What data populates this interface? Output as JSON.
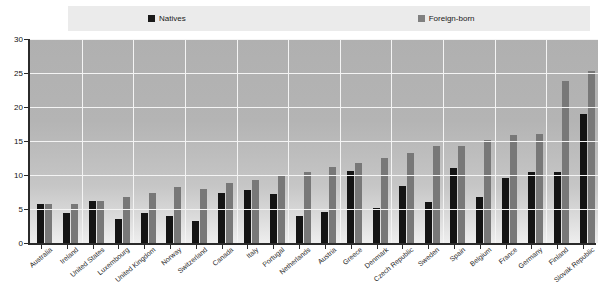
{
  "legend": {
    "items": [
      {
        "label": "Natives",
        "color": "#141414",
        "icon": "square-marker"
      },
      {
        "label": "Foreign-born",
        "color": "#787878",
        "icon": "square-marker"
      }
    ]
  },
  "chart_data": {
    "type": "bar",
    "title": "",
    "xlabel": "",
    "ylabel": "",
    "ylim": [
      0,
      30
    ],
    "yticks": [
      0,
      5,
      10,
      15,
      20,
      25,
      30
    ],
    "grid": true,
    "legend_position": "top",
    "categories": [
      "Australia",
      "Ireland",
      "United States",
      "Luxembourg",
      "United Kingdom",
      "Norway",
      "Switzerland",
      "Canada",
      "Italy",
      "Portugal",
      "Netherlands",
      "Austria",
      "Greece",
      "Denmark",
      "Czech Republic",
      "Sweden",
      "Spain",
      "Belgium",
      "France",
      "Germany",
      "Finland",
      "Slovak Republic"
    ],
    "series": [
      {
        "name": "Natives",
        "color": "#141414",
        "values": [
          5.8,
          4.4,
          6.2,
          3.5,
          4.4,
          4.0,
          3.3,
          7.3,
          7.8,
          7.2,
          4.0,
          4.6,
          10.6,
          5.2,
          8.4,
          6.0,
          11.0,
          6.8,
          9.5,
          10.4,
          10.5,
          19.0
        ]
      },
      {
        "name": "Foreign-born",
        "color": "#787878",
        "values": [
          5.8,
          5.7,
          6.2,
          6.7,
          7.4,
          8.3,
          8.0,
          8.8,
          9.3,
          10.0,
          10.5,
          11.2,
          11.8,
          12.5,
          13.2,
          14.3,
          14.2,
          15.2,
          15.9,
          16.0,
          23.8,
          25.3
        ]
      }
    ]
  }
}
